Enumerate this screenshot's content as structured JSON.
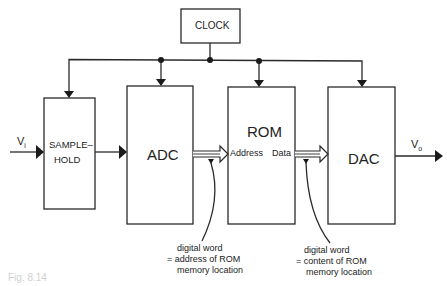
{
  "diagram": {
    "blocks": {
      "clock": "CLOCK",
      "sample_hold_line1": "SAMPLE–",
      "sample_hold_line2": "HOLD",
      "adc": "ADC",
      "rom": "ROM",
      "dac": "DAC"
    },
    "ports": {
      "rom_address": "Address",
      "rom_data": "Data"
    },
    "signals": {
      "input": "V",
      "input_sub": "i",
      "output": "V",
      "output_sub": "o"
    },
    "annotations": {
      "address_note": [
        "digital word",
        "= address of ROM",
        "memory location"
      ],
      "data_note": [
        "digital word",
        "= content of ROM",
        "memory location"
      ]
    },
    "caption": "Fig. 8.14"
  }
}
